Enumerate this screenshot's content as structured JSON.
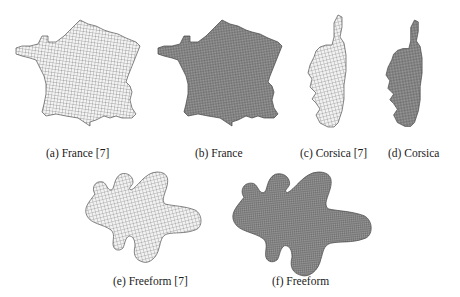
{
  "figure": {
    "subfigures": [
      {
        "id": "a",
        "label": "(a) France [7]",
        "shape": "france",
        "mesh": "coarse-quad",
        "fill": "#c8c8c8"
      },
      {
        "id": "b",
        "label": "(b) France",
        "shape": "france",
        "mesh": "fine-quad",
        "fill": "#7a7a7a"
      },
      {
        "id": "c",
        "label": "(c) Corsica [7]",
        "shape": "corsica",
        "mesh": "coarse-quad",
        "fill": "#cfcfcf"
      },
      {
        "id": "d",
        "label": "(d) Corsica",
        "shape": "corsica",
        "mesh": "fine-quad",
        "fill": "#7a7a7a"
      },
      {
        "id": "e",
        "label": "(e) Freeform [7]",
        "shape": "freeform",
        "mesh": "coarse-quad",
        "fill": "#c4c4c4"
      },
      {
        "id": "f",
        "label": "(f) Freeform",
        "shape": "freeform",
        "mesh": "fine-quad",
        "fill": "#7e7e7e"
      }
    ]
  }
}
